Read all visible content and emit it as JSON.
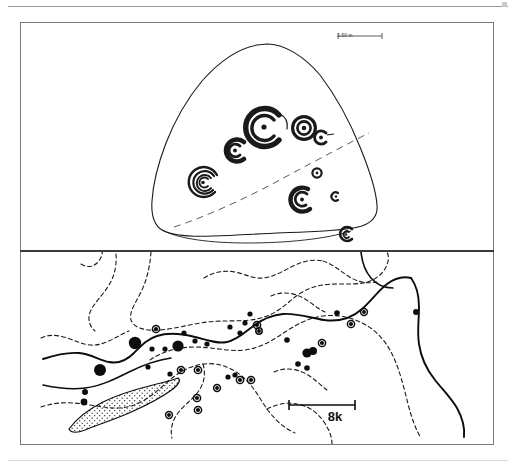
{
  "figure": {
    "panels": [
      {
        "id": "boulder",
        "name": "rock-art boulder plan",
        "scale_bar": {
          "label": "1.50 m",
          "length_px": 44
        },
        "motifs": [
          {
            "id": "m1",
            "type": "cup-and-ring-penannular",
            "cx": 243,
            "cy": 104,
            "r": 19
          },
          {
            "id": "m2",
            "type": "concentric-ring-cup",
            "cx": 283,
            "cy": 105,
            "r": 12
          },
          {
            "id": "m3",
            "type": "small-ring-with-tail",
            "cx": 301,
            "cy": 114,
            "r": 7
          },
          {
            "id": "m4",
            "type": "penannular-spiral",
            "cx": 214,
            "cy": 127,
            "r": 11
          },
          {
            "id": "m5",
            "type": "multiple-concentric-spiral",
            "cx": 182,
            "cy": 158,
            "r": 15
          },
          {
            "id": "m6",
            "type": "small-cup-and-ring",
            "cx": 296,
            "cy": 150,
            "r": 5
          },
          {
            "id": "m7",
            "type": "open-spiral",
            "cx": 281,
            "cy": 176,
            "r": 12
          },
          {
            "id": "m8",
            "type": "crescent-cup",
            "cx": 315,
            "cy": 173,
            "r": 4
          },
          {
            "id": "m9",
            "type": "small-broken-ring",
            "cx": 326,
            "cy": 211,
            "r": 7
          }
        ],
        "annotations": [
          {
            "id": "fracture",
            "type": "dashed-break-line"
          }
        ]
      },
      {
        "id": "map",
        "name": "regional distribution map",
        "scale_bar": {
          "label": "8k",
          "length_px": 66
        },
        "legend_implicit": [
          {
            "symbol": "filled-circle-large",
            "meaning": "major site"
          },
          {
            "symbol": "filled-circle-small",
            "meaning": "minor site"
          },
          {
            "symbol": "ringed-circle",
            "meaning": "rock-art site"
          }
        ],
        "features": [
          {
            "type": "river-solid",
            "count": 2
          },
          {
            "type": "valley-dashed",
            "count": 6
          },
          {
            "type": "stippled-deposit",
            "count": 1
          }
        ],
        "site_counts": {
          "filled_large": 5,
          "filled_small": 20,
          "ringed": 14
        }
      }
    ]
  },
  "colors": {
    "ink": "#111111",
    "frame": "#7a7a7a",
    "divider": "#3a3a3a",
    "rule": "#9a9a9a",
    "paper": "#ffffff"
  }
}
